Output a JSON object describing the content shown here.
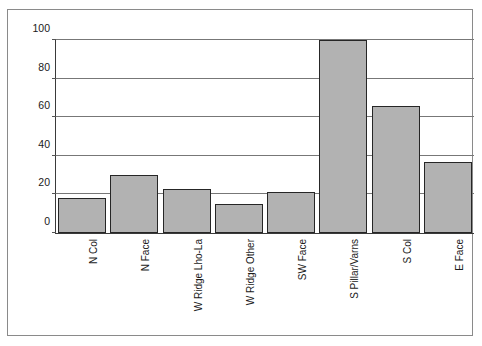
{
  "chart_data": {
    "type": "bar",
    "title": "",
    "xlabel": "",
    "ylabel": "",
    "ylim": [
      0,
      100
    ],
    "yticks": [
      0,
      20,
      40,
      60,
      80,
      100
    ],
    "grid": true,
    "legend": false,
    "categories": [
      "N Col",
      "N Face",
      "W Ridge Lho-La",
      "W Ridge Other",
      "SW Face",
      "S Pillar/Varns",
      "S Col",
      "E Face"
    ],
    "values": [
      18,
      30,
      23,
      15,
      21,
      100,
      66,
      37
    ],
    "bar_fill_color": "#b2b2b2",
    "bar_edge_color": "#262626"
  },
  "figure": {
    "top_cut_text": "",
    "frame_color": "#8a8a8a",
    "axis_color": "#3a3a3a",
    "gridline_color": "#777777",
    "background": "#ffffff"
  }
}
